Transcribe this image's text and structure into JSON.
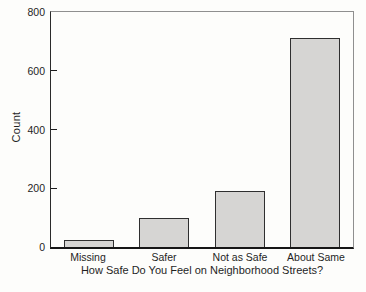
{
  "chart_data": {
    "type": "bar",
    "title": "",
    "xlabel": "How Safe Do You Feel on Neighborhood Streets?",
    "ylabel": "Count",
    "categories": [
      "Missing",
      "Safer",
      "Not as Safe",
      "About Same"
    ],
    "values": [
      25,
      100,
      190,
      710
    ],
    "ylim": [
      0,
      800
    ],
    "yticks": [
      0,
      200,
      400,
      600,
      800
    ],
    "grid": false,
    "legend": "none",
    "bar_fill": "#d6d5d3",
    "bar_border": "#2f2f2f",
    "axis_color": "#1c1c1c",
    "frame_color": "#8f8f8f",
    "text_color": "#1f1f1f",
    "background": "#fdfdfb"
  }
}
